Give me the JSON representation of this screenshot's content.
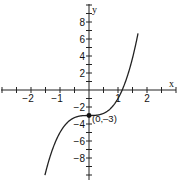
{
  "chart_data": {
    "type": "line",
    "title": "",
    "xlabel": "x",
    "ylabel": "y",
    "xlim": [
      -3.05,
      3.0
    ],
    "ylim": [
      -10.5,
      10.5
    ],
    "grid": false,
    "legend": null,
    "x_ticks": {
      "major_step": 1,
      "minor_step": 0.5,
      "labels": [
        "-2",
        "-1",
        "1",
        "2"
      ],
      "values": [
        -2,
        -1,
        1,
        2
      ]
    },
    "y_ticks": {
      "major_step": 2,
      "minor_step": 1,
      "labels": [
        "8",
        "6",
        "4",
        "2",
        "-2",
        "-4",
        "-6",
        "-8"
      ],
      "values": [
        8,
        6,
        4,
        2,
        -2,
        -4,
        -6,
        -8
      ]
    },
    "series": [
      {
        "name": "y = 2x^3 - 3",
        "function": "2*x^3 - 3",
        "x": [
          -1.5,
          -1.25,
          -1.0,
          -0.75,
          -0.5,
          -0.25,
          0,
          0.25,
          0.5,
          0.75,
          1.0,
          1.14,
          1.25,
          1.5,
          1.65
        ],
        "y": [
          -9.75,
          -6.91,
          -5.0,
          -3.84,
          -3.25,
          -3.03,
          -3.0,
          -2.97,
          -2.75,
          -2.16,
          -1.0,
          0.0,
          0.91,
          3.75,
          5.98
        ]
      }
    ],
    "annotations": [
      {
        "text": "(0,–3)",
        "x": 0,
        "y": -3,
        "marker": "filled-circle"
      }
    ]
  },
  "labels": {
    "x_axis": "x",
    "y_axis": "y",
    "point": "(0,–3)",
    "x_tick_labels": [
      "−2",
      "−1",
      "1",
      "2"
    ],
    "y_tick_labels": [
      "8",
      "6",
      "4",
      "2",
      "−2",
      "−4",
      "−6",
      "−8"
    ]
  }
}
